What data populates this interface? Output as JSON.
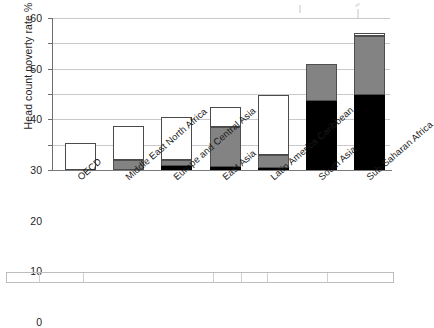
{
  "chart_data": {
    "type": "bar",
    "stacked": true,
    "title": "",
    "xlabel": "",
    "ylabel": "Head count poverty rate %",
    "ylim": [
      0,
      60
    ],
    "yticks": [
      0,
      10,
      20,
      30,
      40,
      50,
      60
    ],
    "grid": true,
    "legend": "none",
    "categories": [
      "OECD",
      "Middle East North Africa",
      "Europe and Central Asia",
      "East Asia",
      "Latin America Caribbean",
      "South Asia",
      "Sub-Saharan Africa"
    ],
    "series": [
      {
        "name": "black",
        "color": "#000000",
        "values": [
          0,
          0,
          1.7,
          1.0,
          0.7,
          27.3,
          29.8
        ]
      },
      {
        "name": "gray",
        "color": "#838383",
        "values": [
          0,
          3.9,
          2.3,
          15.9,
          5.2,
          14.4,
          23.2
        ]
      },
      {
        "name": "white",
        "color": "#ffffff",
        "values": [
          10.7,
          13.6,
          17.0,
          7.9,
          23.9,
          0,
          0.9
        ]
      }
    ],
    "totals": [
      10.7,
      17.5,
      21.0,
      24.8,
      29.8,
      41.7,
      53.9
    ]
  },
  "axis": {
    "y_title": "Head count poverty rate %",
    "tick_labels": [
      "0",
      "10",
      "20",
      "30",
      "40",
      "50",
      "60"
    ]
  },
  "footer": {
    "visible_fragment": ""
  }
}
